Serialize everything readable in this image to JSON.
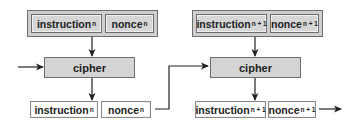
{
  "blocks": [
    {
      "input": {
        "instruction": "instruction",
        "instruction_sub": "n",
        "nonce": "nonce",
        "nonce_sub": "n"
      },
      "cipher": "cipher",
      "output": {
        "instruction": "instruction",
        "instruction_sub": "n",
        "nonce": "nonce",
        "nonce_sub": "n"
      }
    },
    {
      "input": {
        "instruction": "instruction",
        "instruction_sub": "n + 1",
        "nonce": "nonce",
        "nonce_sub": "n + 1"
      },
      "cipher": "cipher",
      "output": {
        "instruction": "instruction",
        "instruction_sub": "n + 1",
        "nonce": "nonce",
        "nonce_sub": "n + 1"
      }
    }
  ],
  "colors": {
    "box_fill": "#d4d4d4",
    "stroke": "#222222",
    "output_fill": "#ffffff"
  }
}
